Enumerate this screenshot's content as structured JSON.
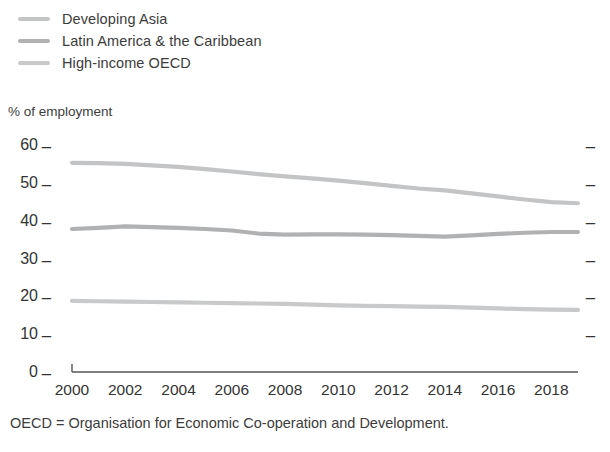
{
  "legend": {
    "position": "top-left",
    "items": [
      {
        "label": "Developing Asia",
        "color": "#c3c4c6",
        "icon": "line-swatch-icon"
      },
      {
        "label": "Latin America & the Caribbean",
        "color": "#b0b1b3",
        "icon": "line-swatch-icon"
      },
      {
        "label": "High-income OECD",
        "color": "#c8c9cb",
        "icon": "line-swatch-icon"
      }
    ]
  },
  "axis": {
    "y_title": "% of employment",
    "y_ticks": [
      "60",
      "50",
      "40",
      "30",
      "20",
      "10",
      "0"
    ],
    "y_tick_dash": "_",
    "x_ticks": [
      "2000",
      "2002",
      "2004",
      "2006",
      "2008",
      "2010",
      "2012",
      "2014",
      "2016",
      "2018"
    ]
  },
  "footnote": {
    "line1": "OECD = Organisation for Economic Co-operation and Development.",
    "line2": ""
  },
  "chart_data": {
    "type": "line",
    "title": "",
    "subtitle": "",
    "xlabel": "",
    "ylabel": "% of employment",
    "ylim": [
      0,
      60
    ],
    "xlim": [
      2000,
      2019
    ],
    "grid": false,
    "legend_position": "top-left",
    "y_ticks": [
      0,
      10,
      20,
      30,
      40,
      50,
      60
    ],
    "x_ticks": [
      2000,
      2002,
      2004,
      2006,
      2008,
      2010,
      2012,
      2014,
      2016,
      2018
    ],
    "x": [
      2000,
      2001,
      2002,
      2003,
      2004,
      2005,
      2006,
      2007,
      2008,
      2009,
      2010,
      2011,
      2012,
      2013,
      2014,
      2015,
      2016,
      2017,
      2018,
      2019
    ],
    "series": [
      {
        "name": "Developing Asia",
        "color": "#c3c4c6",
        "values": [
          55.3,
          55.2,
          55.0,
          54.6,
          54.2,
          53.6,
          53.0,
          52.3,
          51.7,
          51.2,
          50.6,
          49.9,
          49.2,
          48.5,
          48.0,
          47.2,
          46.4,
          45.6,
          44.9,
          44.6
        ]
      },
      {
        "name": "Latin America & the Caribbean",
        "color": "#b0b1b3",
        "values": [
          37.8,
          38.1,
          38.5,
          38.3,
          38.1,
          37.8,
          37.4,
          36.6,
          36.3,
          36.4,
          36.4,
          36.3,
          36.2,
          36.0,
          35.8,
          36.1,
          36.5,
          36.8,
          37.0,
          37.0
        ]
      },
      {
        "name": "High-income OECD",
        "color": "#c8c9cb",
        "values": [
          18.8,
          18.7,
          18.6,
          18.5,
          18.4,
          18.3,
          18.2,
          18.1,
          18.0,
          17.8,
          17.6,
          17.5,
          17.4,
          17.3,
          17.2,
          17.0,
          16.8,
          16.6,
          16.5,
          16.4
        ]
      }
    ]
  }
}
